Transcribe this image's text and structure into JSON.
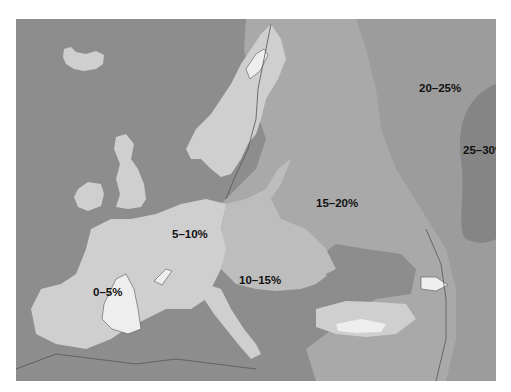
{
  "map": {
    "title": "",
    "colors": {
      "sea": "#8d8d8d",
      "z0_5": "#eeeeee",
      "z5_10": "#cfcfcf",
      "z10_15": "#bdbdbd",
      "z15_20": "#a9a9a9",
      "z20_25": "#9c9c9c",
      "z25_30": "#858585",
      "boundary": "#555555"
    },
    "zones": [
      {
        "id": "z0_5",
        "label": "0–5%"
      },
      {
        "id": "z5_10",
        "label": "5–10%"
      },
      {
        "id": "z10_15",
        "label": "10–15%"
      },
      {
        "id": "z15_20",
        "label": "15–20%"
      },
      {
        "id": "z20_25",
        "label": "20–25%"
      },
      {
        "id": "z25_30",
        "label": "25–30%"
      }
    ]
  }
}
